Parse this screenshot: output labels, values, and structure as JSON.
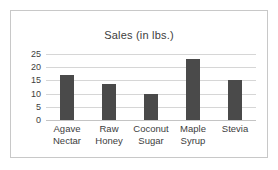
{
  "chart_data": {
    "type": "bar",
    "title": "Sales (in lbs.)",
    "xlabel": "",
    "ylabel": "",
    "categories": [
      "Agave Nectar",
      "Raw Honey",
      "Coconut Sugar",
      "Maple Syrup",
      "Stevia"
    ],
    "category_lines": [
      [
        "Agave",
        "Nectar"
      ],
      [
        "Raw",
        "Honey"
      ],
      [
        "Coconut",
        "Sugar"
      ],
      [
        "Maple",
        "Syrup"
      ],
      [
        "Stevia"
      ]
    ],
    "values": [
      17,
      13.5,
      10,
      23,
      15
    ],
    "ylim": [
      0,
      25
    ],
    "yticks": [
      0,
      5,
      10,
      15,
      20,
      25
    ],
    "ytick_labels": [
      "0",
      "5",
      "10",
      "15",
      "20",
      "25"
    ],
    "grid": true,
    "legend": false,
    "bar_color": "#4a4a4a",
    "grid_color": "#d6d6d6",
    "text_color": "#3d3d3d",
    "border_color": "#c8c8c8",
    "background": "#ffffff"
  }
}
